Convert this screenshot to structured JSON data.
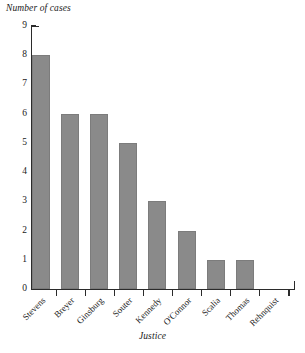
{
  "chart_data": {
    "type": "bar",
    "title": "",
    "subtitle": "",
    "xlabel": "Justice",
    "ylabel": "Number of cases",
    "categories": [
      "Stevens",
      "Breyer",
      "Ginsburg",
      "Souter",
      "Kennedy",
      "O'Connor",
      "Scalia",
      "Thomas",
      "Rehnquist"
    ],
    "values": [
      8,
      6,
      6,
      5,
      3,
      2,
      1,
      1,
      0
    ],
    "ylim": [
      0,
      9
    ],
    "ytick_labels": [
      "0",
      "1",
      "2",
      "3",
      "4",
      "5",
      "6",
      "7",
      "8",
      "9"
    ],
    "ytick_values": [
      0,
      1,
      2,
      3,
      4,
      5,
      6,
      7,
      8,
      9
    ],
    "grid": false,
    "legend": null,
    "bar_color": "#8a8a8a",
    "axis_color": "#2b2b2b",
    "background_color": "#ffffff",
    "xtick_label_rotation": "-45"
  }
}
